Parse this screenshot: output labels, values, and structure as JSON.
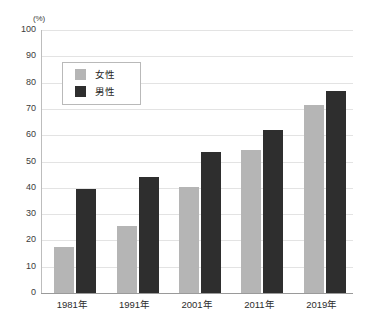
{
  "chart_data": {
    "type": "bar",
    "title": "",
    "subtitle": "",
    "xlabel": "",
    "ylabel": "",
    "unit_label": "(%)",
    "categories": [
      "1981年",
      "1991年",
      "2001年",
      "2011年",
      "2019年"
    ],
    "series": [
      {
        "name": "女性",
        "color": "#b5b5b5",
        "values": [
          17.5,
          25.5,
          40.5,
          54.5,
          71.5
        ]
      },
      {
        "name": "男性",
        "color": "#2e2e2e",
        "values": [
          39.5,
          44.0,
          53.5,
          62.0,
          77.0
        ]
      }
    ],
    "ylim": [
      0,
      100
    ],
    "ytick_step": 10,
    "ytick_labels": [
      "100",
      "90",
      "80",
      "70",
      "60",
      "50",
      "40",
      "30",
      "20",
      "10",
      "0"
    ],
    "grid": true,
    "grid_color": "#e3e3e3",
    "axis_color": "#9a9a9a",
    "legend_position": "upper-left-inside",
    "legend_entries": [
      "女性",
      "男性"
    ],
    "background": "#ffffff"
  }
}
